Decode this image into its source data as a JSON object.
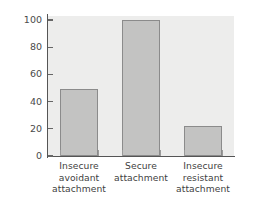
{
  "chart_data": {
    "type": "bar",
    "title": "",
    "subtitle": "",
    "xlabel": "",
    "ylabel": "Number of observations",
    "categories": [
      "Insecure avoidant attachment",
      "Secure attachment",
      "Insecure resistant attachment"
    ],
    "category_lines": [
      [
        "Insecure",
        "avoidant",
        "attachment"
      ],
      [
        "Secure",
        "attachment"
      ],
      [
        "Insecure",
        "resistant",
        "attachment"
      ]
    ],
    "values": [
      49,
      100,
      22
    ],
    "ylim": [
      0,
      100
    ],
    "ytick_labels": [
      "0",
      "20",
      "40",
      "60",
      "80",
      "100"
    ],
    "ytick_values": [
      0,
      20,
      40,
      60,
      80,
      100
    ],
    "grid": false,
    "legend": false,
    "legend_position": "none",
    "colors": {
      "bar_fill": "#c3c3c2",
      "bar_edge": "#8b8b8b",
      "plot_background": "#ededec",
      "figure_background": "#ffffff",
      "axis": "#555555",
      "text": "#4a4a4a"
    }
  }
}
